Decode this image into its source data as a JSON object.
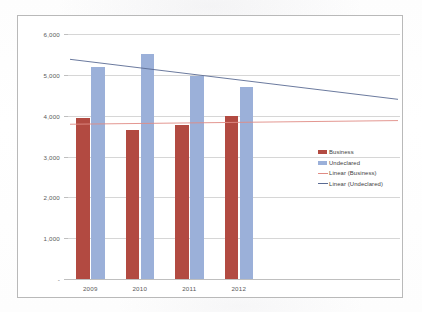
{
  "chart_data": {
    "type": "bar",
    "title": "",
    "xlabel": "",
    "ylabel": "",
    "categories": [
      "2009",
      "2010",
      "2011",
      "2012"
    ],
    "series": [
      {
        "name": "Business",
        "values": [
          3950,
          3650,
          3780,
          4000
        ],
        "color": "#b24a41"
      },
      {
        "name": "Undeclared",
        "values": [
          5200,
          5500,
          4980,
          4700
        ],
        "color": "#9bb0d9"
      }
    ],
    "trendlines": [
      {
        "name": "Linear (Business)",
        "color": "#e08b84",
        "start_value": 3790,
        "end_value": 3880
      },
      {
        "name": "Linear (Undeclared)",
        "color": "#5a6b93",
        "start_value": 5380,
        "end_value": 4400
      }
    ],
    "ylim": [
      0,
      6000
    ],
    "ytick_values": [
      0,
      1000,
      2000,
      3000,
      4000,
      5000,
      6000
    ],
    "ytick_labels": [
      "-",
      "1,000",
      "2,000",
      "3,000",
      "4,000",
      "5,000",
      "6,000"
    ],
    "grid": true,
    "legend_position": "right",
    "legend": [
      {
        "label": "Business",
        "marker": "bar",
        "color": "#b24a41"
      },
      {
        "label": "Undeclared",
        "marker": "bar",
        "color": "#9bb0d9"
      },
      {
        "label": "Linear (Business)",
        "marker": "line",
        "color": "#e08b84"
      },
      {
        "label": "Linear (Undeclared)",
        "marker": "line",
        "color": "#5a6b93"
      }
    ]
  }
}
